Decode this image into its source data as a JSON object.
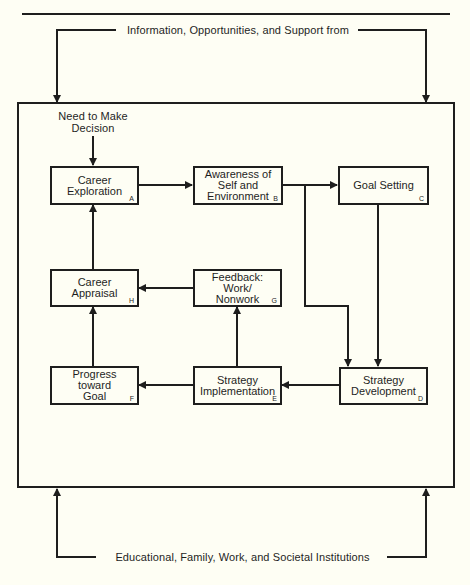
{
  "top_label": "Information, Opportunities, and Support from",
  "bottom_label": "Educational, Family, Work, and Societal Institutions",
  "start_label": "Need to Make\nDecision",
  "boxes": {
    "A": {
      "label": "Career\nExploration",
      "letter": "A"
    },
    "B": {
      "label": "Awareness of\nSelf and\nEnvironment",
      "letter": "B"
    },
    "C": {
      "label": "Goal Setting",
      "letter": "C"
    },
    "D": {
      "label": "Strategy\nDevelopment",
      "letter": "D"
    },
    "E": {
      "label": "Strategy\nImplementation",
      "letter": "E"
    },
    "F": {
      "label": "Progress\ntoward\nGoal",
      "letter": "F"
    },
    "G": {
      "label": "Feedback:\nWork/\nNonwork",
      "letter": "G"
    },
    "H": {
      "label": "Career\nAppraisal",
      "letter": "H"
    }
  },
  "flows": [
    [
      "Need to Make Decision",
      "A"
    ],
    [
      "A",
      "B"
    ],
    [
      "B",
      "C"
    ],
    [
      "B",
      "D"
    ],
    [
      "C",
      "D"
    ],
    [
      "D",
      "E"
    ],
    [
      "E",
      "F"
    ],
    [
      "E",
      "G"
    ],
    [
      "G",
      "H"
    ],
    [
      "F",
      "H"
    ],
    [
      "H",
      "A"
    ],
    [
      "Information, Opportunities, and Support from",
      "frame"
    ],
    [
      "Educational, Family, Work, and Societal Institutions",
      "frame"
    ]
  ],
  "colors": {
    "ink": "#1e1e1e",
    "paper": "#fefef4"
  }
}
